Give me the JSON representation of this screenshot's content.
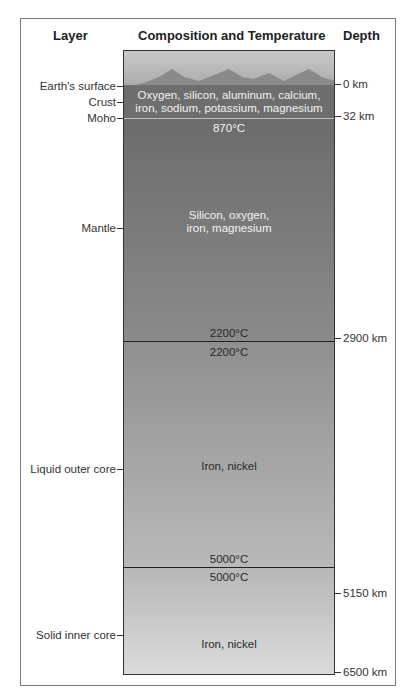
{
  "headers": {
    "layer": "Layer",
    "composition": "Composition and Temperature",
    "depth": "Depth"
  },
  "layers": [
    {
      "label": "Earth's surface"
    },
    {
      "label": "Crust",
      "composition": [
        "Oxygen, silicon, aluminum, calcium,",
        "iron, sodium, potassium, magnesium"
      ]
    },
    {
      "label": "Moho",
      "temp_top": "870°C"
    },
    {
      "label": "Mantle",
      "composition": [
        "Silicon, oxygen,",
        "iron, magnesium"
      ],
      "temp_bottom": "2200°C"
    },
    {
      "label": "Liquid outer core",
      "temp_top": "2200°C",
      "composition": "Iron, nickel",
      "temp_bottom": "5000°C"
    },
    {
      "label": "Solid inner core",
      "temp_top": "5000°C",
      "composition": "Iron, nickel"
    }
  ],
  "depths": [
    "0 km",
    "32 km",
    "2900 km",
    "5150 km",
    "6500 km"
  ],
  "colors": {
    "crust": "#6e6e6e",
    "mantle": "#7a7a7a",
    "outer_core": "#a5a5a5",
    "inner_core": "#cacaca"
  }
}
